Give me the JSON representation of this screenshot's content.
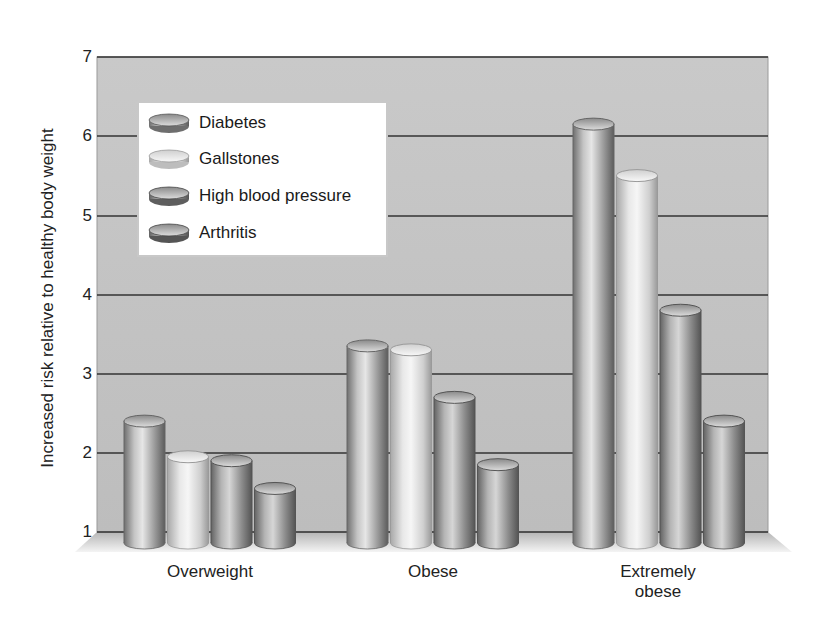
{
  "chart_data": {
    "type": "bar",
    "title": "",
    "xlabel": "",
    "ylabel": "Increased risk relative to healthy body weight",
    "ylim": [
      1,
      7
    ],
    "yticks": [
      1,
      2,
      3,
      4,
      5,
      6,
      7
    ],
    "grid": true,
    "legend_position": "upper left (inside plot)",
    "style": "3D cylinders, grayscale",
    "categories": [
      "Overweight",
      "Obese",
      "Extremely obese"
    ],
    "series": [
      {
        "name": "Diabetes",
        "color": "#a9a9a9",
        "values": [
          2.4,
          3.35,
          6.15
        ]
      },
      {
        "name": "Gallstones",
        "color": "#e4e4e4",
        "values": [
          1.95,
          3.3,
          5.5
        ]
      },
      {
        "name": "High blood pressure",
        "color": "#9c9c9c",
        "values": [
          1.9,
          2.7,
          3.8
        ]
      },
      {
        "name": "Arthritis",
        "color": "#8f8f8f",
        "values": [
          1.55,
          1.85,
          2.4
        ]
      }
    ]
  },
  "labels": {
    "yaxis": "Increased risk relative to healthy body weight",
    "yticks": [
      "7",
      "6",
      "5",
      "4",
      "3",
      "2",
      "1"
    ],
    "categories": [
      "Overweight",
      "Obese",
      "Extremely",
      "obese"
    ],
    "legend": [
      "Diabetes",
      "Gallstones",
      "High blood pressure",
      "Arthritis"
    ]
  }
}
